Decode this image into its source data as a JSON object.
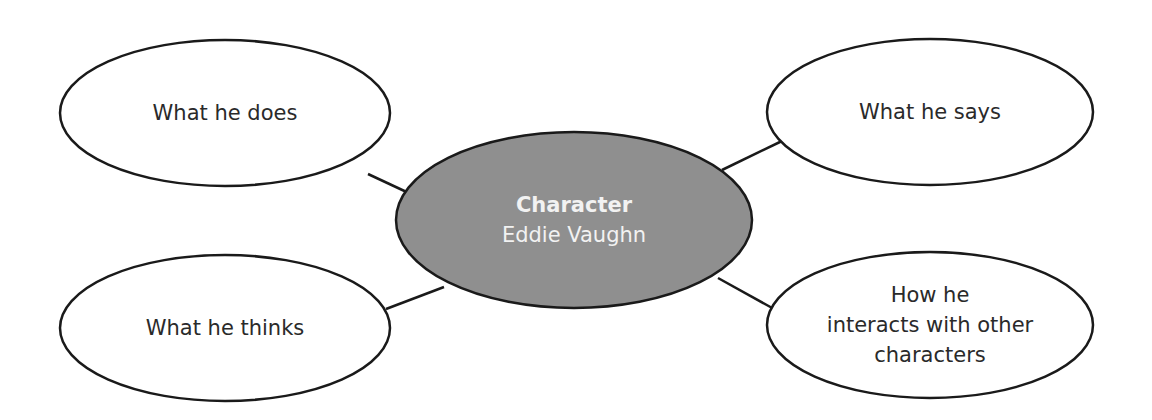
{
  "diagram": {
    "center": {
      "title": "Character",
      "subtitle": "Eddie Vaughn",
      "fill": "#8f8f8f"
    },
    "nodes": [
      {
        "id": "does",
        "label": "What he does"
      },
      {
        "id": "says",
        "label": "What he says"
      },
      {
        "id": "thinks",
        "label": "What he thinks"
      },
      {
        "id": "interacts",
        "lines": [
          "How he",
          "interacts with other",
          "characters"
        ]
      }
    ],
    "colors": {
      "stroke": "#1a1a1a",
      "node_fill": "#ffffff",
      "text": "#2a2a2a",
      "center_text": "#f2f2f2"
    }
  }
}
